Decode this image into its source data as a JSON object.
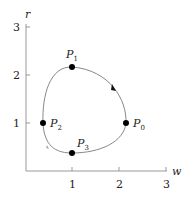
{
  "diagram": {
    "axes": {
      "x_label": "w",
      "y_label": "r",
      "x_ticks": [
        "1",
        "2",
        "3"
      ],
      "y_ticks": [
        "1",
        "2",
        "3"
      ]
    },
    "points": [
      {
        "name": "P",
        "sub": "0",
        "w": 2.15,
        "r": 1.0
      },
      {
        "name": "P",
        "sub": "1",
        "w": 1.0,
        "r": 2.15
      },
      {
        "name": "P",
        "sub": "2",
        "w": 0.4,
        "r": 1.0
      },
      {
        "name": "P",
        "sub": "3",
        "w": 1.0,
        "r": 0.4
      }
    ],
    "curve": {
      "type": "closed-orbit",
      "direction": "counterclockwise"
    },
    "colors": {
      "curve": "#888888",
      "axis": "#999999",
      "point": "#000000"
    }
  }
}
